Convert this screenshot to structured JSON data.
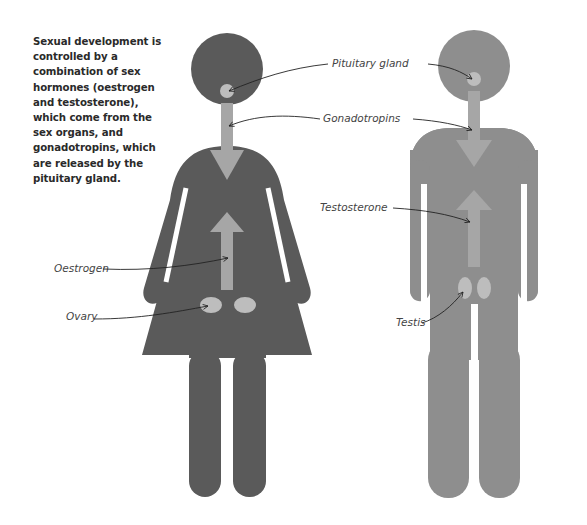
{
  "intro_text": "Sexual development is controlled by a combination of sex hormones (oestrogen and testosterone), which come from the sex organs, and gonadotropins, which are released by the pituitary gland.",
  "labels": {
    "pituitary": "Pituitary gland",
    "gonadotropins": "Gonadotropins",
    "testosterone": "Testosterone",
    "oestrogen": "Oestrogen",
    "ovary": "Ovary",
    "testis": "Testis"
  },
  "colors": {
    "female_figure": "#5a5a5a",
    "male_figure": "#8e8e8e",
    "arrow_fill": "#a6a6a6",
    "gland_fill": "#bdbdbd",
    "label_text": "#444444",
    "leader_line": "#222222"
  },
  "figures": [
    {
      "name": "female",
      "organ": "Ovary",
      "hormone": "Oestrogen"
    },
    {
      "name": "male",
      "organ": "Testis",
      "hormone": "Testosterone"
    }
  ]
}
